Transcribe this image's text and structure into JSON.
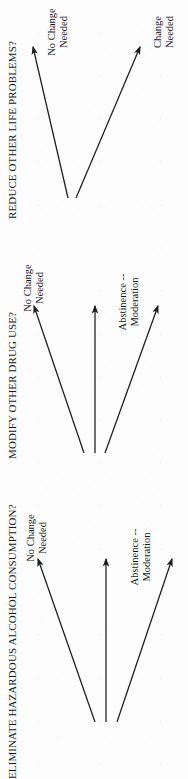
{
  "document": {
    "orientation": "rotated-90-ccw",
    "background_color": "#fdfdfd",
    "ink_color": "#1a1c1f"
  },
  "diagrams": [
    {
      "id": "reduce-other-life-problems",
      "title": "REDUCE OTHER LIFE PROBLEMS?",
      "branch_count": 2,
      "branches": [
        {
          "id": "change-needed",
          "label": "Change Needed",
          "direction": "down"
        },
        {
          "id": "no-change-needed",
          "label": "No Change Needed",
          "direction": "up"
        }
      ]
    },
    {
      "id": "modify-other-drug-use",
      "title": "MODIFY OTHER DRUG USE?",
      "branch_count": 3,
      "branches": [
        {
          "id": "abstinence-moderation",
          "label": "Abstinence -- Moderation",
          "direction": "down"
        },
        {
          "id": "middle-arrow",
          "label": "",
          "direction": "straight"
        },
        {
          "id": "no-change-needed",
          "label": "No Change\nNeeded",
          "direction": "up"
        }
      ]
    },
    {
      "id": "eliminate-hazardous-alcohol-consumption",
      "title": "ELIMINATE HAZARDOUS ALCOHOL CONSUMPTION?",
      "branch_count": 3,
      "branches": [
        {
          "id": "abstinence-moderation",
          "label": "Abstinence  --  Moderation",
          "direction": "down"
        },
        {
          "id": "middle-arrow",
          "label": "",
          "direction": "straight"
        },
        {
          "id": "no-change-needed",
          "label": "No Change\nNeeded",
          "direction": "up"
        }
      ]
    }
  ]
}
